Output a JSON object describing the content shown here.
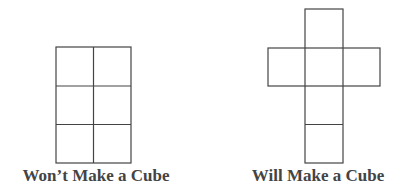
{
  "figures": [
    {
      "id": "left",
      "caption": "Won't Make a Cube",
      "caption_display": "Won’t Make a Cube",
      "layout": "2 columns x 3 rows grid of squares",
      "squares": 6
    },
    {
      "id": "right",
      "caption": "Will Make a Cube",
      "caption_display": "Will Make a Cube",
      "layout": "cross-shaped net: vertical column of 4 squares with one square on each side of the second square",
      "squares": 6
    }
  ],
  "colors": {
    "line": "#444444",
    "text": "#444444",
    "background": "#ffffff"
  }
}
